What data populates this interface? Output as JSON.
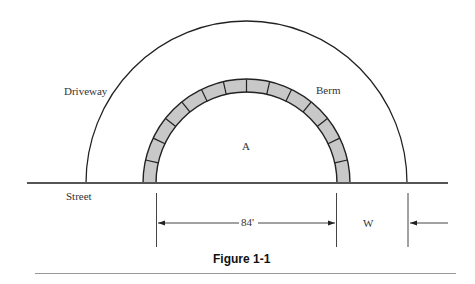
{
  "figure": {
    "caption": "Figure 1-1",
    "labels": {
      "driveway": "Driveway",
      "berm": "Berm",
      "area": "A",
      "street": "Street",
      "dimension_inner": "84'",
      "dimension_width": "W"
    },
    "colors": {
      "line": "#222222",
      "berm_fill": "#c8c8c8",
      "street_line": "#555555",
      "rule": "#999999"
    },
    "geometry": {
      "center_x": 246.5,
      "street_y": 183,
      "outer_driveway_radius": 161,
      "berm_outer_radius": 103.5,
      "berm_inner_radius": 90.5,
      "berm_segments": 14
    }
  }
}
